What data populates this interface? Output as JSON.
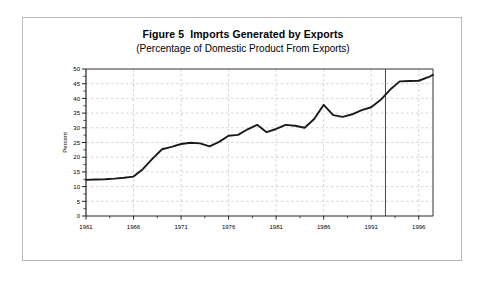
{
  "figure": {
    "title": "Figure 5  Imports Generated by Exports",
    "subtitle": "(Percentage of Domestic Product From Exports)",
    "border_color": "#b9b9b9"
  },
  "chart_data": {
    "type": "line",
    "title": "Figure 5  Imports Generated by Exports",
    "subtitle": "(Percentage of Domestic Product From Exports)",
    "xlabel": "",
    "ylabel": "Percent",
    "xlim": [
      1961,
      1997.5
    ],
    "ylim": [
      0,
      50
    ],
    "ytick_step": 5,
    "yticks": [
      0,
      5,
      10,
      15,
      20,
      25,
      30,
      35,
      40,
      45,
      50
    ],
    "ytick_labels": [
      "0",
      "5",
      "10",
      "15",
      "20",
      "25",
      "30",
      "35",
      "40",
      "45",
      "50"
    ],
    "y_minor_step": 2.5,
    "xticks": [
      1961,
      1966,
      1971,
      1976,
      1981,
      1986,
      1991,
      1996
    ],
    "xtick_labels": [
      "1961",
      "1966",
      "1971",
      "1976",
      "1981",
      "1986",
      "1991",
      "1996"
    ],
    "x_minor_step": 2.5,
    "grid": true,
    "grid_style": "dashed",
    "grid_color": "#b5b5b5",
    "legend": "none",
    "line_color": "#1a1a1a",
    "line_width": 1.9,
    "divider_year": 1992.5,
    "divider_color": "#4a4a4a",
    "x": [
      1961,
      1962,
      1963,
      1964,
      1965,
      1966,
      1967,
      1968,
      1969,
      1970,
      1971,
      1972,
      1973,
      1974,
      1975,
      1976,
      1977,
      1978,
      1979,
      1980,
      1981,
      1982,
      1983,
      1984,
      1985,
      1986,
      1987,
      1988,
      1989,
      1990,
      1991,
      1992,
      1993,
      1994,
      1995,
      1996,
      1997,
      1997.5
    ],
    "values": [
      12.3,
      12.4,
      12.5,
      12.7,
      13.0,
      13.4,
      16.0,
      19.5,
      22.7,
      23.5,
      24.5,
      24.9,
      24.7,
      23.7,
      25.2,
      27.3,
      27.6,
      29.5,
      31.0,
      28.5,
      29.6,
      31.0,
      30.7,
      30.0,
      33.0,
      37.8,
      34.3,
      33.7,
      34.6,
      36.0,
      37.0,
      39.5,
      43.0,
      45.8,
      45.9,
      46.0,
      47.2,
      48.0
    ],
    "series": [
      {
        "name": "Imports generated by exports",
        "values": [
          12.3,
          12.4,
          12.5,
          12.7,
          13.0,
          13.4,
          16.0,
          19.5,
          22.7,
          23.5,
          24.5,
          24.9,
          24.7,
          23.7,
          25.2,
          27.3,
          27.6,
          29.5,
          31.0,
          28.5,
          29.6,
          31.0,
          30.7,
          30.0,
          33.0,
          37.8,
          34.3,
          33.7,
          34.6,
          36.0,
          37.0,
          39.5,
          43.0,
          45.8,
          45.9,
          46.0,
          47.2,
          48.0
        ]
      }
    ]
  }
}
